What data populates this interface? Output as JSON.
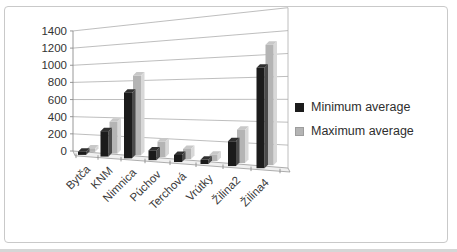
{
  "chart_data": {
    "type": "bar",
    "style": "3d-column",
    "title": "",
    "xlabel": "",
    "ylabel": "",
    "categories": [
      "Bytča",
      "KNM",
      "Nimnica",
      "Púchov",
      "Terchová",
      "Vrútky",
      "Žilina2",
      "Žilina4"
    ],
    "series": [
      {
        "name": "Minimum average",
        "color": "#1b1b1b",
        "values": [
          35,
          280,
          700,
          100,
          70,
          40,
          230,
          900
        ]
      },
      {
        "name": "Maximum average",
        "color": "#b4b4b4",
        "values": [
          40,
          350,
          850,
          160,
          100,
          60,
          310,
          1080
        ]
      }
    ],
    "ylim": [
      0,
      1400
    ],
    "ytick_step": 200,
    "yticks": [
      "0",
      "200",
      "400",
      "600",
      "800",
      "1000",
      "1200",
      "1400"
    ],
    "grid": true,
    "legend_position": "right-middle",
    "x_labels_rotation_deg": -45
  },
  "style_colors": {
    "min_bar_front": "#1b1b1b",
    "min_bar_side": "#4a4a4a",
    "min_bar_top": "#303030",
    "max_bar_front": "#b4b4b4",
    "max_bar_side": "#d8d8d8",
    "max_bar_top": "#c8c8c8",
    "gridline": "#adadad",
    "axis_line": "#8c8c8c",
    "floor_fill": "#f0f0f0",
    "tick_text": "#333333",
    "frame_border": "#c9c9c9"
  }
}
